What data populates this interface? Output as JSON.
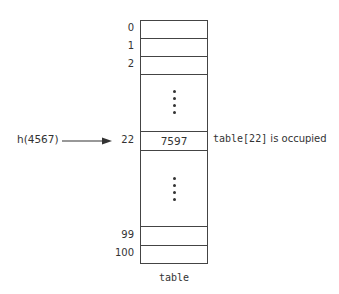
{
  "diagram": {
    "type": "hash-table",
    "hash_call": "h(4567)",
    "target_index": "22",
    "table_label": "table",
    "rows": [
      {
        "index": "0",
        "value": ""
      },
      {
        "index": "1",
        "value": ""
      },
      {
        "index": "2",
        "value": ""
      },
      {
        "index": "",
        "value": "ellipsis"
      },
      {
        "index": "22",
        "value": "7597"
      },
      {
        "index": "",
        "value": "ellipsis"
      },
      {
        "index": "99",
        "value": ""
      },
      {
        "index": "100",
        "value": ""
      }
    ],
    "annotation": {
      "code": "table[22]",
      "text": " is occupied"
    },
    "colors": {
      "line": "#444444",
      "text": "#333333",
      "background": "#ffffff"
    }
  }
}
